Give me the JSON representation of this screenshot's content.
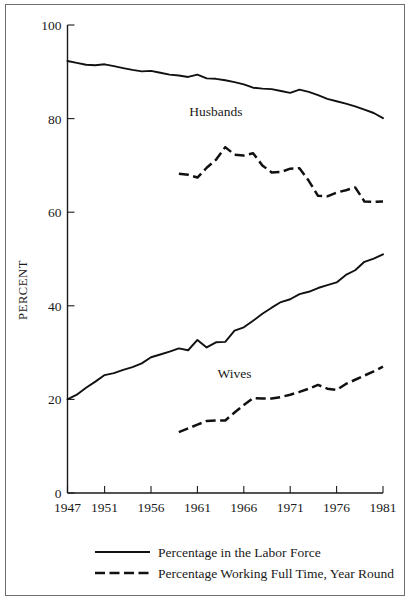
{
  "chart_data": {
    "type": "line",
    "title": "",
    "subtitle": "",
    "xlabel": "",
    "ylabel": "PERCENT",
    "xlim": [
      1947,
      1981
    ],
    "ylim": [
      0,
      100
    ],
    "grid": false,
    "legend_position": "below-axes",
    "x_ticks": [
      1947,
      1951,
      1956,
      1961,
      1966,
      1971,
      1976,
      1981
    ],
    "x_tick_labels": [
      "1947",
      "1951",
      "1956",
      "1961",
      "1966",
      "1971",
      "1976",
      "1981"
    ],
    "y_ticks": [
      0,
      20,
      40,
      60,
      80,
      100
    ],
    "y_tick_labels": [
      "0",
      "20",
      "40",
      "60",
      "80",
      "100"
    ],
    "annotations": [
      {
        "text": "Husbands",
        "x": 1963,
        "y": 80.5
      },
      {
        "text": "Wives",
        "x": 1965,
        "y": 24.5
      }
    ],
    "legend": [
      {
        "label": "Percentage in the Labor Force",
        "style": "solid"
      },
      {
        "label": "Percentage Working Full Time, Year Round",
        "style": "dashed"
      }
    ],
    "series": [
      {
        "name": "Husbands — Percentage in the Labor Force",
        "group": "Husbands",
        "style": "solid",
        "x": [
          1947,
          1948,
          1949,
          1950,
          1951,
          1952,
          1953,
          1954,
          1955,
          1956,
          1957,
          1958,
          1959,
          1960,
          1961,
          1962,
          1963,
          1964,
          1965,
          1966,
          1967,
          1968,
          1969,
          1970,
          1971,
          1972,
          1973,
          1974,
          1975,
          1976,
          1977,
          1978,
          1979,
          1980,
          1981
        ],
        "values": [
          92.3,
          91.9,
          91.5,
          91.4,
          91.6,
          91.2,
          90.8,
          90.4,
          90.1,
          90.2,
          89.8,
          89.4,
          89.2,
          88.9,
          89.4,
          88.6,
          88.5,
          88.2,
          87.8,
          87.3,
          86.6,
          86.4,
          86.3,
          85.9,
          85.5,
          86.2,
          85.7,
          85.0,
          84.2,
          83.7,
          83.2,
          82.6,
          81.9,
          81.2,
          80.1
        ]
      },
      {
        "name": "Husbands — Percentage Working Full Time, Year Round",
        "group": "Husbands",
        "style": "dashed",
        "x": [
          1959,
          1960,
          1961,
          1962,
          1963,
          1964,
          1965,
          1966,
          1967,
          1968,
          1969,
          1970,
          1971,
          1972,
          1973,
          1974,
          1975,
          1976,
          1977,
          1978,
          1979,
          1980,
          1981
        ],
        "values": [
          68.2,
          68.0,
          67.4,
          69.5,
          71.2,
          73.9,
          72.3,
          72.1,
          72.6,
          70.0,
          68.5,
          68.6,
          69.3,
          69.4,
          66.7,
          63.5,
          63.4,
          64.2,
          64.7,
          65.3,
          62.3,
          62.2,
          62.3
        ]
      },
      {
        "name": "Wives — Percentage in the Labor Force",
        "group": "Wives",
        "style": "solid",
        "x": [
          1947,
          1948,
          1949,
          1950,
          1951,
          1952,
          1953,
          1954,
          1955,
          1956,
          1957,
          1958,
          1959,
          1960,
          1961,
          1962,
          1963,
          1964,
          1965,
          1966,
          1967,
          1968,
          1969,
          1970,
          1971,
          1972,
          1973,
          1974,
          1975,
          1976,
          1977,
          1978,
          1979,
          1980,
          1981
        ],
        "values": [
          20.0,
          21.0,
          22.5,
          23.8,
          25.2,
          25.6,
          26.3,
          26.9,
          27.7,
          29.0,
          29.6,
          30.2,
          30.9,
          30.5,
          32.7,
          31.1,
          32.2,
          32.3,
          34.7,
          35.4,
          36.8,
          38.3,
          39.6,
          40.8,
          41.4,
          42.5,
          43.0,
          43.8,
          44.4,
          45.0,
          46.6,
          47.6,
          49.4,
          50.1,
          51.0
        ]
      },
      {
        "name": "Wives — Percentage Working Full Time, Year Round",
        "group": "Wives",
        "style": "dashed",
        "x": [
          1959,
          1960,
          1961,
          1962,
          1963,
          1964,
          1965,
          1966,
          1967,
          1968,
          1969,
          1970,
          1971,
          1972,
          1973,
          1974,
          1975,
          1976,
          1977,
          1978,
          1979,
          1980,
          1981
        ],
        "values": [
          13.0,
          13.8,
          14.6,
          15.4,
          15.5,
          15.5,
          17.2,
          18.8,
          20.3,
          20.2,
          20.2,
          20.5,
          21.0,
          21.6,
          22.3,
          23.1,
          22.3,
          22.0,
          23.3,
          24.2,
          25.1,
          26.0,
          27.0
        ]
      }
    ]
  }
}
